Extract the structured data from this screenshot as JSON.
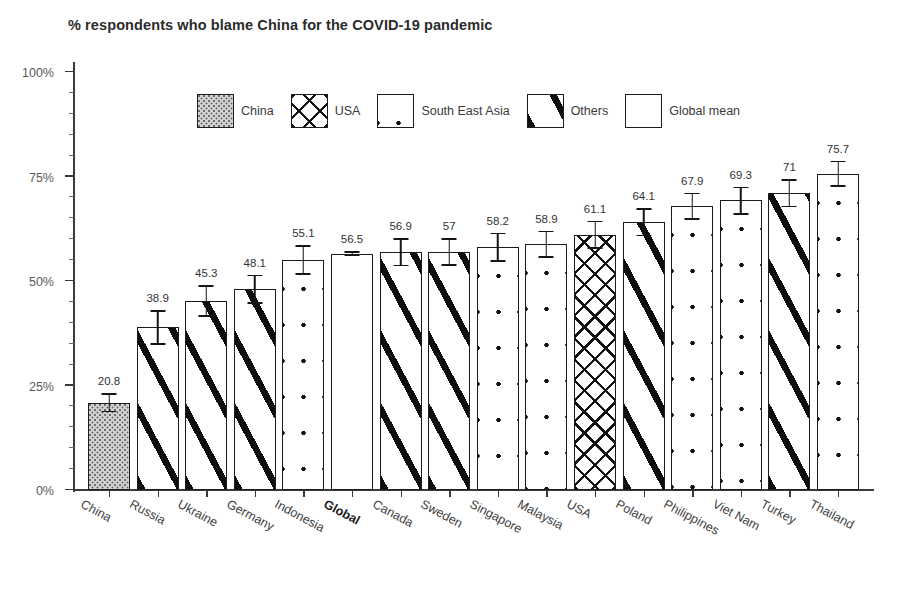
{
  "chart_data": {
    "type": "bar",
    "title": "% respondents who blame China for the COVID-19 pandemic",
    "xlabel": "",
    "ylabel": "",
    "ylim": [
      0,
      100
    ],
    "ytick_labels": [
      "0%",
      "25%",
      "50%",
      "75%",
      "100%"
    ],
    "ytick_values": [
      0,
      25,
      50,
      75,
      100
    ],
    "grid": false,
    "legend_position": "inside-top-center",
    "categories": [
      "China",
      "Russia",
      "Ukraine",
      "Germany",
      "Indonesia",
      "Global",
      "Canada",
      "Sweden",
      "Singapore",
      "Malaysia",
      "USA",
      "Poland",
      "Philippines",
      "Viet Nam",
      "Turkey",
      "Thailand"
    ],
    "values": [
      20.8,
      38.9,
      45.3,
      48.1,
      55.1,
      56.5,
      56.9,
      57,
      58.2,
      58.9,
      61.1,
      64.1,
      67.9,
      69.3,
      71,
      75.7
    ],
    "value_labels": [
      "20.8",
      "38.9",
      "45.3",
      "48.1",
      "55.1",
      "56.5",
      "56.9",
      "57",
      "58.2",
      "58.9",
      "61.1",
      "64.1",
      "67.9",
      "69.3",
      "71",
      "75.7"
    ],
    "groups": [
      "China",
      "Others",
      "Others",
      "Others",
      "South East Asia",
      "Global mean",
      "Others",
      "Others",
      "South East Asia",
      "South East Asia",
      "USA",
      "Others",
      "South East Asia",
      "South East Asia",
      "Others",
      "South East Asia"
    ],
    "error_low": [
      18.6,
      34.8,
      41.5,
      44.5,
      51.5,
      55.9,
      53.5,
      53.6,
      54.6,
      55.6,
      57.7,
      60.7,
      64.6,
      65.9,
      67.6,
      72.5
    ],
    "error_high": [
      23.1,
      43.0,
      49.0,
      51.5,
      58.5,
      57.1,
      60.2,
      60.3,
      61.6,
      62.0,
      64.4,
      67.4,
      71.1,
      72.6,
      74.3,
      78.8
    ],
    "bold_categories": [
      "Global"
    ],
    "legend": [
      {
        "label": "China",
        "pattern": "stipple"
      },
      {
        "label": "USA",
        "pattern": "cross"
      },
      {
        "label": "South East Asia",
        "pattern": "dots"
      },
      {
        "label": "Others",
        "pattern": "stripe"
      },
      {
        "label": "Global mean",
        "pattern": "plain"
      }
    ],
    "colors": {
      "axis": "#3a3a3a",
      "bar_outline": "#1c1c1c",
      "bar_fill": "#ffffff",
      "china_fill": "#d3d3d3",
      "pattern_ink": "#0d0d0d",
      "text": "#333333",
      "background": "#ffffff"
    }
  }
}
